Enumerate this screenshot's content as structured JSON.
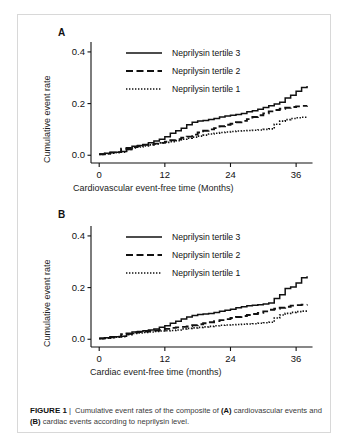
{
  "figure": {
    "caption_label": "FIGURE 1",
    "caption_separator": "|",
    "caption_text_1": " Cumulative event rates of the composite of ",
    "caption_bold_a": "(A)",
    "caption_text_2": " cardiovascular events and ",
    "caption_bold_b": "(B)",
    "caption_text_3": " cardiac events according to neprilysin level.",
    "border_color": "#d8d8d8",
    "line_color": "#111111",
    "background": "#ffffff"
  },
  "panels": [
    {
      "letter": "A",
      "ylabel": "Cumulative event rate",
      "xlabel": "Cardiovascular event-free time (Months)",
      "legend": [
        {
          "label": "Neprilysin tertile 3",
          "style": "solid"
        },
        {
          "label": "Neprilysin tertile 2",
          "style": "dashed"
        },
        {
          "label": "Neprilysin tertile 1",
          "style": "dotted"
        }
      ]
    },
    {
      "letter": "B",
      "ylabel": "Cumulative event rate",
      "xlabel": "Cardiac event-free time (months)",
      "legend": [
        {
          "label": "Neprilysin tertile 3",
          "style": "solid"
        },
        {
          "label": "Neprilysin tertile 2",
          "style": "dashed"
        },
        {
          "label": "Neprilysin tertile 1",
          "style": "dotted"
        }
      ]
    }
  ],
  "chart_data": [
    {
      "type": "line",
      "panel": "A",
      "title": "",
      "xlabel": "Cardiovascular event-free time (Months)",
      "ylabel": "Cumulative event rate",
      "xlim": [
        -1.5,
        40
      ],
      "ylim": [
        -0.03,
        0.45
      ],
      "xticks": [
        0,
        12,
        24,
        36
      ],
      "xticklabels": [
        "0",
        "12",
        "24",
        "36"
      ],
      "yticks": [
        0.0,
        0.2,
        0.4
      ],
      "yticklabels": [
        "0.0",
        "0.2",
        "0.4"
      ],
      "grid": false,
      "legend_position": "upper-center",
      "step": "post",
      "series": [
        {
          "name": "Neprilysin tertile 3",
          "style": "solid",
          "x": [
            0,
            1,
            2,
            3,
            4,
            5,
            6,
            7,
            8,
            9,
            10,
            11,
            12,
            13,
            14,
            15,
            16,
            17,
            18,
            19,
            20,
            21,
            22,
            23,
            24,
            25,
            26,
            27,
            28,
            29,
            30,
            31,
            32,
            33,
            34,
            35,
            36,
            37,
            38
          ],
          "y": [
            0.005,
            0.008,
            0.012,
            0.012,
            0.015,
            0.022,
            0.035,
            0.038,
            0.042,
            0.048,
            0.055,
            0.062,
            0.072,
            0.085,
            0.095,
            0.105,
            0.118,
            0.128,
            0.133,
            0.135,
            0.138,
            0.142,
            0.148,
            0.152,
            0.155,
            0.158,
            0.162,
            0.168,
            0.172,
            0.178,
            0.185,
            0.192,
            0.198,
            0.205,
            0.222,
            0.232,
            0.248,
            0.262,
            0.268
          ]
        },
        {
          "name": "Neprilysin tertile 2",
          "style": "dashed",
          "x": [
            0,
            1,
            2,
            3,
            4,
            5,
            6,
            7,
            8,
            9,
            10,
            11,
            12,
            13,
            14,
            15,
            16,
            17,
            18,
            19,
            20,
            21,
            22,
            23,
            24,
            25,
            26,
            27,
            28,
            29,
            30,
            31,
            32,
            33,
            34,
            35,
            36,
            37,
            38
          ],
          "y": [
            0.004,
            0.006,
            0.01,
            0.012,
            0.025,
            0.028,
            0.032,
            0.036,
            0.04,
            0.042,
            0.045,
            0.048,
            0.052,
            0.058,
            0.062,
            0.068,
            0.072,
            0.08,
            0.088,
            0.095,
            0.1,
            0.105,
            0.112,
            0.118,
            0.122,
            0.128,
            0.133,
            0.14,
            0.148,
            0.155,
            0.162,
            0.17,
            0.175,
            0.18,
            0.184,
            0.187,
            0.189,
            0.191,
            0.192
          ]
        },
        {
          "name": "Neprilysin tertile 1",
          "style": "dotted",
          "x": [
            0,
            1,
            2,
            3,
            4,
            5,
            6,
            7,
            8,
            9,
            10,
            11,
            12,
            13,
            14,
            15,
            16,
            17,
            18,
            19,
            20,
            21,
            22,
            23,
            24,
            25,
            26,
            27,
            28,
            29,
            30,
            31,
            32,
            33,
            34,
            35,
            36,
            37,
            38
          ],
          "y": [
            0.003,
            0.005,
            0.008,
            0.01,
            0.012,
            0.022,
            0.028,
            0.032,
            0.036,
            0.04,
            0.044,
            0.048,
            0.05,
            0.052,
            0.056,
            0.062,
            0.066,
            0.07,
            0.074,
            0.078,
            0.082,
            0.085,
            0.088,
            0.09,
            0.092,
            0.094,
            0.095,
            0.096,
            0.097,
            0.098,
            0.1,
            0.102,
            0.12,
            0.132,
            0.138,
            0.142,
            0.145,
            0.147,
            0.148
          ]
        }
      ]
    },
    {
      "type": "line",
      "panel": "B",
      "title": "",
      "xlabel": "Cardiac event-free time (months)",
      "ylabel": "Cumulative event rate",
      "xlim": [
        -1.5,
        40
      ],
      "ylim": [
        -0.03,
        0.45
      ],
      "xticks": [
        0,
        12,
        24,
        36
      ],
      "xticklabels": [
        "0",
        "12",
        "24",
        "36"
      ],
      "yticks": [
        0.0,
        0.2,
        0.4
      ],
      "yticklabels": [
        "0.0",
        "0.2",
        "0.4"
      ],
      "grid": false,
      "legend_position": "upper-center",
      "step": "post",
      "series": [
        {
          "name": "Neprilysin tertile 3",
          "style": "solid",
          "x": [
            0,
            1,
            2,
            3,
            4,
            5,
            6,
            7,
            8,
            9,
            10,
            11,
            12,
            13,
            14,
            15,
            16,
            17,
            18,
            19,
            20,
            21,
            22,
            23,
            24,
            25,
            26,
            27,
            28,
            29,
            30,
            31,
            32,
            33,
            34,
            35,
            36,
            37,
            38
          ],
          "y": [
            0.004,
            0.006,
            0.01,
            0.01,
            0.012,
            0.02,
            0.028,
            0.03,
            0.033,
            0.036,
            0.04,
            0.046,
            0.052,
            0.062,
            0.07,
            0.078,
            0.086,
            0.092,
            0.096,
            0.098,
            0.1,
            0.104,
            0.108,
            0.112,
            0.116,
            0.122,
            0.126,
            0.13,
            0.132,
            0.134,
            0.136,
            0.14,
            0.158,
            0.172,
            0.196,
            0.202,
            0.218,
            0.238,
            0.244
          ]
        },
        {
          "name": "Neprilysin tertile 2",
          "style": "dashed",
          "x": [
            0,
            1,
            2,
            3,
            4,
            5,
            6,
            7,
            8,
            9,
            10,
            11,
            12,
            13,
            14,
            15,
            16,
            17,
            18,
            19,
            20,
            21,
            22,
            23,
            24,
            25,
            26,
            27,
            28,
            29,
            30,
            31,
            32,
            33,
            34,
            35,
            36,
            37,
            38
          ],
          "y": [
            0.003,
            0.005,
            0.008,
            0.01,
            0.02,
            0.022,
            0.026,
            0.028,
            0.03,
            0.032,
            0.034,
            0.036,
            0.04,
            0.044,
            0.046,
            0.048,
            0.05,
            0.054,
            0.058,
            0.062,
            0.066,
            0.07,
            0.074,
            0.078,
            0.082,
            0.086,
            0.09,
            0.094,
            0.098,
            0.102,
            0.108,
            0.114,
            0.118,
            0.122,
            0.126,
            0.13,
            0.132,
            0.134,
            0.135
          ]
        },
        {
          "name": "Neprilysin tertile 1",
          "style": "dotted",
          "x": [
            0,
            1,
            2,
            3,
            4,
            5,
            6,
            7,
            8,
            9,
            10,
            11,
            12,
            13,
            14,
            15,
            16,
            17,
            18,
            19,
            20,
            21,
            22,
            23,
            24,
            25,
            26,
            27,
            28,
            29,
            30,
            31,
            32,
            33,
            34,
            35,
            36,
            37,
            38
          ],
          "y": [
            0.002,
            0.004,
            0.006,
            0.008,
            0.01,
            0.018,
            0.022,
            0.024,
            0.026,
            0.028,
            0.03,
            0.032,
            0.033,
            0.034,
            0.036,
            0.04,
            0.042,
            0.044,
            0.046,
            0.048,
            0.05,
            0.052,
            0.054,
            0.055,
            0.056,
            0.057,
            0.058,
            0.059,
            0.06,
            0.062,
            0.064,
            0.066,
            0.082,
            0.094,
            0.1,
            0.104,
            0.107,
            0.109,
            0.11
          ]
        }
      ]
    }
  ]
}
